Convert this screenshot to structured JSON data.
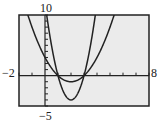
{
  "chart_data": {
    "type": "line",
    "title": "",
    "xlabel": "",
    "ylabel": "",
    "xlim": [
      -2,
      8
    ],
    "ylim": [
      -5,
      10
    ],
    "xscale": 1,
    "yscale": 1,
    "grid": false,
    "tick_labels": {
      "xmin": "−2",
      "xmax": "8",
      "ymax": "10",
      "ymin": "−5"
    },
    "series": [
      {
        "name": "y1 = x^2 - 4x + 3",
        "a": 1,
        "b": -4,
        "c": 3,
        "x": [
          -2,
          -1,
          0,
          1,
          2,
          3,
          4,
          5,
          6,
          7,
          8
        ],
        "values": [
          15,
          8,
          3,
          0,
          -1,
          0,
          3,
          8,
          15,
          24,
          35
        ]
      },
      {
        "name": "y2 = 4x^2 - 16x + 12",
        "a": 4,
        "b": -16,
        "c": 12,
        "x": [
          -2,
          -1,
          0,
          1,
          2,
          3,
          4,
          5,
          6,
          7,
          8
        ],
        "values": [
          60,
          32,
          12,
          0,
          -4,
          0,
          12,
          32,
          60,
          96,
          140
        ]
      }
    ],
    "colors": {
      "background": "#ebebeb",
      "curve": "#222222",
      "axes": "#222222"
    }
  }
}
